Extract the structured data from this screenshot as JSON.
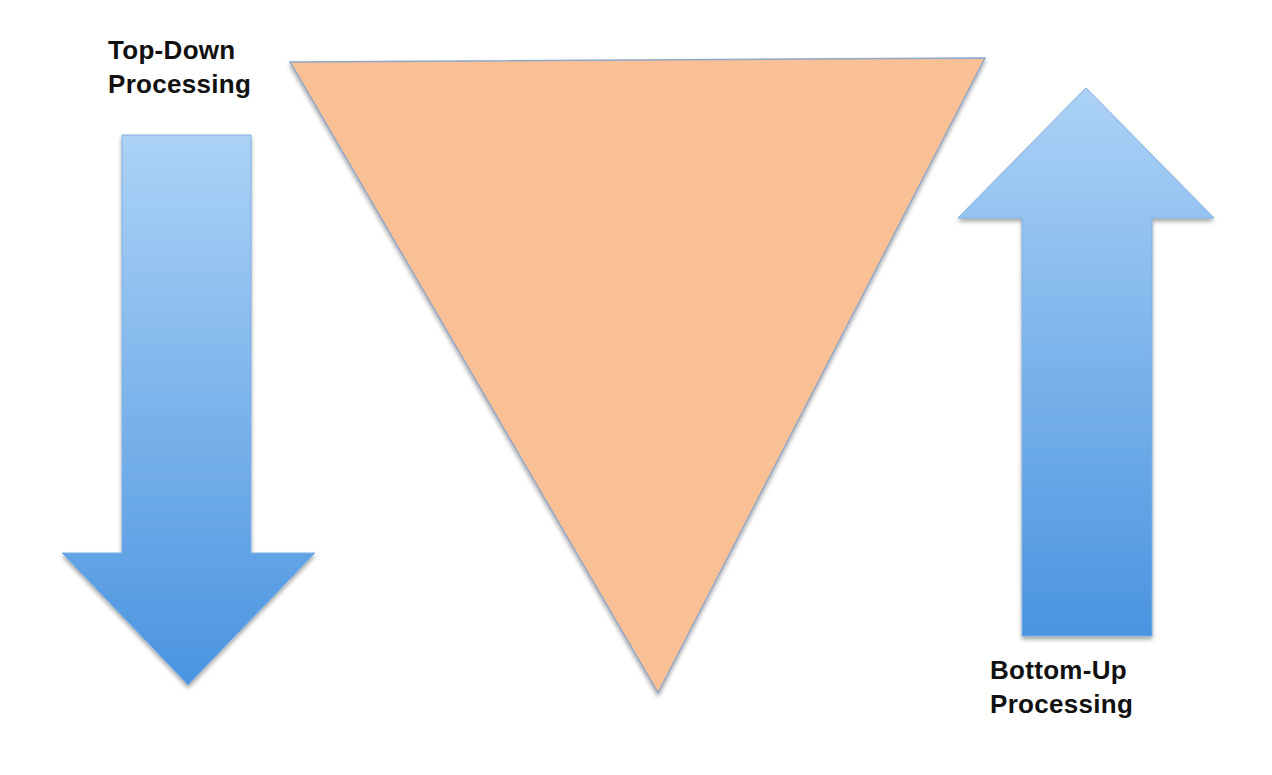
{
  "diagram": {
    "labels": {
      "top_down": {
        "line1": "Top-Down",
        "line2": "Processing"
      },
      "bottom_up": {
        "line1": "Bottom-Up",
        "line2": "Processing"
      }
    },
    "shapes": {
      "down_arrow": {
        "direction": "down",
        "color_top": "#a9d0f5",
        "color_bottom": "#4a93df"
      },
      "inverted_triangle": {
        "fill": "#f9bf95",
        "stroke": "#8fa8c8"
      },
      "up_arrow": {
        "direction": "up",
        "color_top": "#a9d0f5",
        "color_bottom": "#4a93df"
      }
    },
    "colors": {
      "arrow_light": "#a9d0f5",
      "arrow_dark": "#4a93df",
      "triangle_fill": "#f9bf95",
      "text": "#111111",
      "background": "#ffffff"
    }
  }
}
